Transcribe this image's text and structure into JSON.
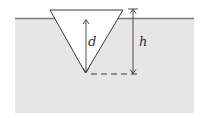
{
  "diagram": {
    "labels": {
      "d": "d",
      "h": "h"
    },
    "colors": {
      "background": "#ffffff",
      "liquid": "#e6e6e6",
      "surface_line": "#7a7a7a",
      "cone_fill": "#ffffff",
      "stroke": "#3a3a3a"
    }
  }
}
